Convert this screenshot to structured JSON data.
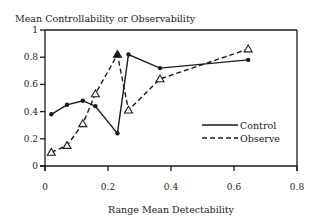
{
  "chart_data": {
    "type": "line",
    "title": "Mean Controllability or Observability",
    "xlabel": "Range Mean Detectability",
    "ylabel": "Mean Controllability or Observability",
    "xlim": [
      0,
      0.8
    ],
    "ylim": [
      0,
      1
    ],
    "xticks": [
      0,
      0.2,
      0.4,
      0.6,
      0.8
    ],
    "xtick_labels": [
      "0",
      "0.2",
      "0.4",
      "0.6",
      "0.8"
    ],
    "yticks": [
      0,
      0.2,
      0.4,
      0.6,
      0.8,
      1
    ],
    "ytick_labels": [
      "0",
      "0.2",
      "0.4",
      "0.6",
      "0.8",
      "1"
    ],
    "grid": false,
    "legend_position": "center-right",
    "series": [
      {
        "name": "Control",
        "style": "solid",
        "marker": "dot",
        "x": [
          0.02,
          0.07,
          0.12,
          0.16,
          0.23,
          0.265,
          0.365,
          0.645
        ],
        "y": [
          0.38,
          0.45,
          0.48,
          0.44,
          0.24,
          0.82,
          0.72,
          0.78
        ]
      },
      {
        "name": "Observe",
        "style": "dashed",
        "marker": "triangle",
        "x": [
          0.02,
          0.07,
          0.12,
          0.16,
          0.23,
          0.265,
          0.365,
          0.645
        ],
        "y": [
          0.1,
          0.15,
          0.31,
          0.53,
          0.82,
          0.41,
          0.64,
          0.86
        ]
      }
    ]
  }
}
